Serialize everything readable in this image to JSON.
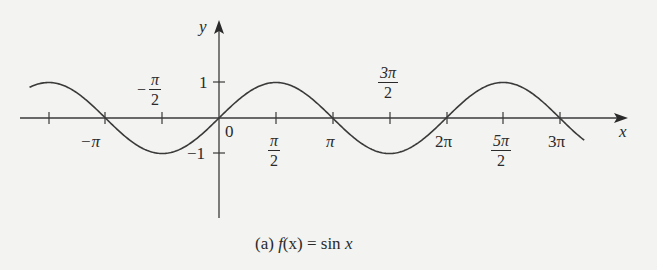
{
  "figure": {
    "caption_prefix": "(a)",
    "caption_func": "f",
    "caption_arg": "(x)",
    "caption_eq": " = sin ",
    "caption_var": "x",
    "axis_x_label": "x",
    "axis_y_label": "y",
    "origin_label": "0",
    "y_tick_labels": {
      "pos_one": "1",
      "neg_one": "−1"
    },
    "x_tick_labels": {
      "neg_pi_half": {
        "sign": "−",
        "num": "π",
        "den": "2"
      },
      "neg_pi": "−π",
      "pi_half": {
        "num": "π",
        "den": "2"
      },
      "pi": "π",
      "three_pi_half": {
        "num": "3π",
        "den": "2"
      },
      "two_pi": "2π",
      "five_pi_half": {
        "num": "5π",
        "den": "2"
      },
      "three_pi": "3π"
    },
    "colors": {
      "ink": "#2a2a2a",
      "curve": "#3a3a3a",
      "background": "#f3f3f1"
    }
  },
  "chart_data": {
    "type": "line",
    "title": "(a) f(x) = sin x",
    "xlabel": "x",
    "ylabel": "y",
    "function": "sin(x)",
    "xlim": [
      -5.24,
      10.1
    ],
    "ylim": [
      -1,
      1
    ],
    "x_ticks": [
      -4.712,
      -3.1416,
      -1.5708,
      0,
      1.5708,
      3.1416,
      4.7124,
      6.2832,
      7.854,
      9.4248
    ],
    "x_tick_labels": [
      "",
      "−π",
      "−π/2",
      "0",
      "π/2",
      "π",
      "3π/2",
      "2π",
      "5π/2",
      "3π"
    ],
    "y_ticks": [
      -1,
      1
    ],
    "y_tick_labels": [
      "−1",
      "1"
    ],
    "grid": false,
    "legend": null,
    "series": [
      {
        "name": "sin x",
        "x": [
          -5.236,
          -4.712,
          -3.927,
          -3.1416,
          -2.356,
          -1.5708,
          -0.785,
          0,
          0.785,
          1.5708,
          2.356,
          3.1416,
          3.927,
          4.7124,
          5.498,
          6.2832,
          7.069,
          7.854,
          8.639,
          9.4248,
          10.08
        ],
        "values": [
          0.866,
          1,
          0.707,
          0,
          -0.707,
          -1,
          -0.707,
          0,
          0.707,
          1,
          0.707,
          0,
          -0.707,
          -1,
          -0.707,
          0,
          0.707,
          1,
          0.707,
          0,
          -0.616
        ]
      }
    ]
  }
}
